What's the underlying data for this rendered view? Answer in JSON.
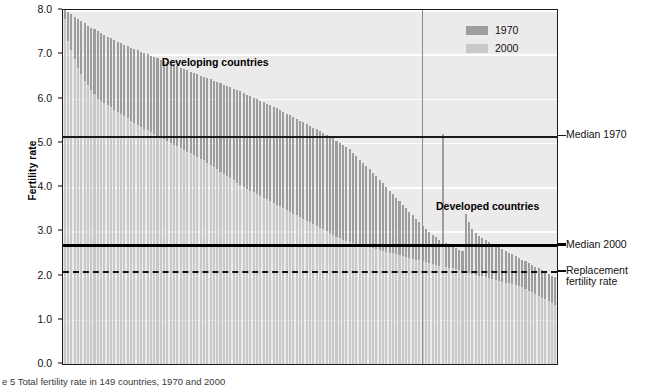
{
  "chart_data": {
    "type": "bar",
    "title": "",
    "xlabel": "",
    "ylabel": "Fertility rate",
    "ylim": [
      0.0,
      8.0
    ],
    "ytick_labels": [
      "8.0",
      "7.0",
      "6.0",
      "5.0",
      "4.0",
      "3.0",
      "2.0",
      "1.0",
      "0.0"
    ],
    "ytick_values": [
      8.0,
      7.0,
      6.0,
      5.0,
      4.0,
      3.0,
      2.0,
      1.0,
      0.0
    ],
    "grid": "horizontal",
    "legend_position": "top-right",
    "x_axis_note": "149 countries sorted by descending 1970 fertility rate; no individual country tick labels shown",
    "series": [
      {
        "name": "1970",
        "color": "#9d9d9d",
        "values": [
          8.02,
          7.95,
          7.9,
          7.85,
          7.8,
          7.76,
          7.7,
          7.65,
          7.6,
          7.56,
          7.52,
          7.48,
          7.44,
          7.4,
          7.36,
          7.32,
          7.28,
          7.25,
          7.21,
          7.18,
          7.15,
          7.12,
          7.09,
          7.06,
          7.03,
          7.0,
          6.97,
          6.94,
          6.91,
          6.88,
          6.85,
          6.82,
          6.79,
          6.76,
          6.73,
          6.7,
          6.67,
          6.64,
          6.61,
          6.58,
          6.55,
          6.52,
          6.49,
          6.46,
          6.43,
          6.4,
          6.37,
          6.34,
          6.31,
          6.28,
          6.25,
          6.22,
          6.19,
          6.16,
          6.12,
          6.09,
          6.06,
          6.02,
          5.99,
          5.95,
          5.92,
          5.88,
          5.85,
          5.81,
          5.78,
          5.74,
          5.7,
          5.66,
          5.62,
          5.58,
          5.54,
          5.5,
          5.46,
          5.42,
          5.38,
          5.34,
          5.3,
          5.26,
          5.22,
          5.18,
          5.15,
          5.1,
          5.05,
          5.0,
          4.95,
          4.9,
          4.85,
          4.78,
          4.7,
          4.62,
          4.55,
          4.48,
          4.4,
          4.32,
          4.24,
          4.16,
          4.08,
          4.0,
          3.92,
          3.84,
          3.76,
          3.68,
          3.6,
          3.52,
          3.44,
          3.36,
          3.28,
          3.2,
          3.12,
          3.05,
          2.98,
          2.92,
          2.86,
          2.8,
          5.2,
          2.74,
          2.7,
          2.66,
          2.62,
          2.58,
          2.55,
          3.4,
          3.2,
          3.05,
          2.95,
          2.9,
          2.85,
          2.8,
          2.76,
          2.72,
          2.68,
          2.64,
          2.6,
          2.56,
          2.52,
          2.48,
          2.44,
          2.4,
          2.36,
          2.32,
          2.28,
          2.24,
          2.2,
          2.16,
          2.12,
          2.08,
          2.04,
          2.0,
          1.96
        ],
        "median": 5.15
      },
      {
        "name": "2000",
        "color": "#c9c9c9",
        "values": [
          7.8,
          7.3,
          7.1,
          6.9,
          6.7,
          6.55,
          6.4,
          6.3,
          6.2,
          6.1,
          6.0,
          5.95,
          5.9,
          5.85,
          5.8,
          5.75,
          5.7,
          5.65,
          5.6,
          5.55,
          5.5,
          5.45,
          5.4,
          5.36,
          5.32,
          5.28,
          5.24,
          5.2,
          5.16,
          5.12,
          5.08,
          5.04,
          5.0,
          4.96,
          4.92,
          4.88,
          4.84,
          4.8,
          4.76,
          4.72,
          4.68,
          4.64,
          4.6,
          4.55,
          4.5,
          4.45,
          4.4,
          4.35,
          4.3,
          4.25,
          4.2,
          4.15,
          4.1,
          4.05,
          4.0,
          3.96,
          3.92,
          3.88,
          3.84,
          3.8,
          3.76,
          3.72,
          3.68,
          3.64,
          3.6,
          3.56,
          3.52,
          3.48,
          3.44,
          3.4,
          3.36,
          3.32,
          3.28,
          3.24,
          3.2,
          3.16,
          3.12,
          3.08,
          3.04,
          3.0,
          2.96,
          2.92,
          2.88,
          2.84,
          2.8,
          2.78,
          2.76,
          2.74,
          2.72,
          2.7,
          2.68,
          2.66,
          2.64,
          2.62,
          2.6,
          2.58,
          2.56,
          2.54,
          2.52,
          2.5,
          2.48,
          2.46,
          2.44,
          2.42,
          2.4,
          2.38,
          2.36,
          2.34,
          2.32,
          2.3,
          2.28,
          2.26,
          2.24,
          2.22,
          2.7,
          2.2,
          2.18,
          2.16,
          2.14,
          2.12,
          2.1,
          2.08,
          2.06,
          2.04,
          2.02,
          2.0,
          1.98,
          1.96,
          1.94,
          1.92,
          1.9,
          1.88,
          1.86,
          1.84,
          1.82,
          1.8,
          1.78,
          1.76,
          1.74,
          1.7,
          1.66,
          1.62,
          1.58,
          1.54,
          1.5,
          1.46,
          1.42,
          1.38,
          1.34
        ],
        "median": 2.67
      }
    ],
    "reference_lines": [
      {
        "name": "Median 1970",
        "value": 5.15,
        "style": "solid-thin",
        "color": "#1a1a1a"
      },
      {
        "name": "Median 2000",
        "value": 2.67,
        "style": "solid-thick",
        "color": "#000000"
      },
      {
        "name": "Replacement fertility rate",
        "value": 2.1,
        "style": "dashed",
        "color": "#111111"
      }
    ],
    "annotations": [
      {
        "text": "Developing countries",
        "x_frac": 0.2,
        "y_value": 6.8
      },
      {
        "text": "Developed countries",
        "x_frac": 0.755,
        "y_value": 3.55
      }
    ],
    "group_divider": {
      "x_frac": 0.727,
      "label": "developing / developed split"
    }
  },
  "axis": {
    "y_title": "Fertility rate"
  },
  "legend": {
    "items": [
      {
        "label": "1970",
        "color": "#9d9d9d"
      },
      {
        "label": "2000",
        "color": "#c9c9c9"
      }
    ]
  },
  "annotations": {
    "developing": "Developing countries",
    "developed": "Developed countries"
  },
  "right_labels": {
    "median_1970": "Median 1970",
    "median_2000": "Median 2000",
    "replacement_line1": "Replacement",
    "replacement_line2": "fertility rate"
  },
  "caption": {
    "text": "e 5  Total fertility rate in 149 countries, 1970 and 2000"
  }
}
